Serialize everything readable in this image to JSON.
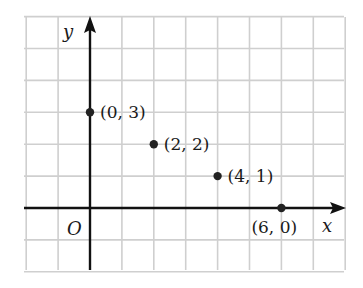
{
  "chart_data": {
    "type": "scatter",
    "title": "",
    "xlabel": "x",
    "ylabel": "y",
    "origin_label": "O",
    "grid": true,
    "xlim": [
      -2,
      8
    ],
    "ylim": [
      -2,
      6
    ],
    "points": [
      {
        "x": 0,
        "y": 3,
        "label": "(0, 3)"
      },
      {
        "x": 2,
        "y": 2,
        "label": "(2, 2)"
      },
      {
        "x": 4,
        "y": 1,
        "label": "(4, 1)"
      },
      {
        "x": 6,
        "y": 0,
        "label": "(6, 0)"
      }
    ]
  },
  "colors": {
    "grid": "#cfcfcf",
    "axis": "#111111",
    "point": "#222222",
    "text": "#1a1a1a"
  }
}
